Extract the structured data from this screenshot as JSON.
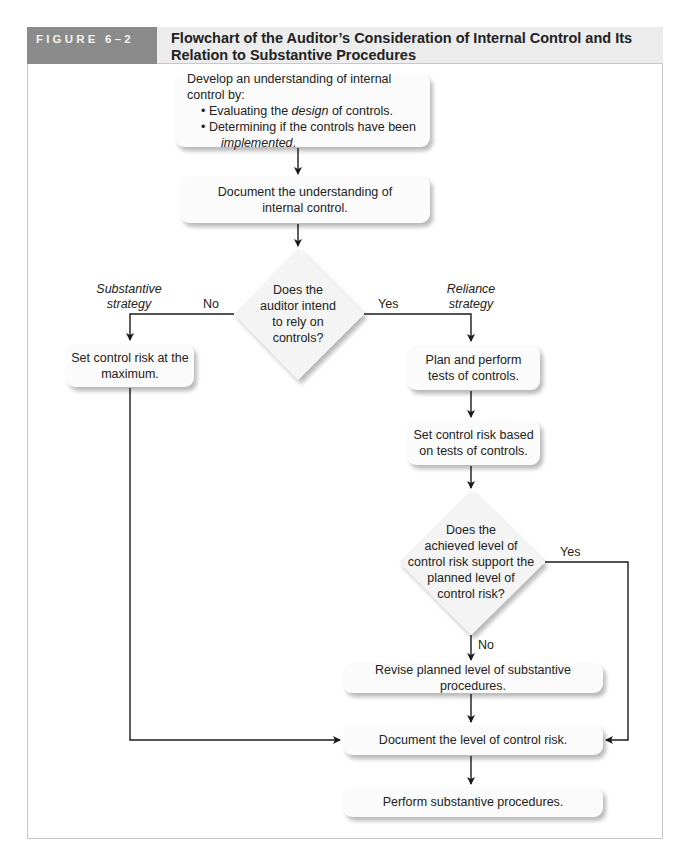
{
  "header": {
    "figure_label": "FIGURE 6–2",
    "title_line1": "Flowchart of the Auditor’s Consideration of Internal Control and Its",
    "title_line2": "Relation to Substantive Procedures"
  },
  "nodes": {
    "develop": {
      "intro": "Develop an understanding of internal control by:",
      "bullet1_pre": "Evaluating the ",
      "bullet1_em": "design",
      "bullet1_post": " of controls.",
      "bullet2": "Determining if the controls have been",
      "bullet2_em": "implemented",
      "bullet2_post": "."
    },
    "document_understanding": {
      "line1": "Document the understanding of",
      "line2": "internal control."
    },
    "decision_rely": {
      "line1": "Does the",
      "line2": "auditor intend",
      "line3": "to rely on",
      "line4": "controls?"
    },
    "set_max": {
      "line1": "Set control risk at the",
      "line2": "maximum."
    },
    "plan_tests": {
      "line1": "Plan and perform",
      "line2": "tests of controls."
    },
    "set_based": {
      "line1": "Set control risk based",
      "line2": "on tests of controls."
    },
    "decision_support": {
      "line1": "Does the",
      "line2": "achieved level of",
      "line3": "control risk support the",
      "line4": "planned level of",
      "line5": "control risk?"
    },
    "revise": {
      "text": "Revise planned level of substantive procedures."
    },
    "document_level": {
      "text": "Document the level of control risk."
    },
    "perform": {
      "text": "Perform substantive procedures."
    }
  },
  "edge_labels": {
    "no_1": "No",
    "yes_1": "Yes",
    "yes_2": "Yes",
    "no_2": "No",
    "substantive_line1": "Substantive",
    "substantive_line2": "strategy",
    "reliance_line1": "Reliance",
    "reliance_line2": "strategy"
  },
  "colors": {
    "header_label_bg": "#8a8a8a",
    "header_title_bg": "#ececec",
    "box_fill": "#fbfbfb",
    "diamond_fill": "#f4f4f4",
    "line": "#1a1a1a",
    "frame": "#c8c8c8"
  }
}
